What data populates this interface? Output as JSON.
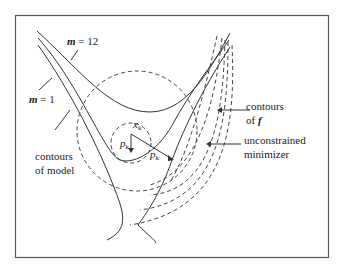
{
  "diagram": {
    "labels": {
      "m12_var": "m",
      "m12_eq": " = 12",
      "m1_var": "m",
      "m1_eq": " = 1",
      "model_line1": "contours",
      "model_line2": "of model",
      "f_line1": "contours",
      "f_line2_prefix": "of ",
      "f_line2_var": "f",
      "min_line1": "unconstrained",
      "min_line2": "minimizer",
      "xk_var": "x",
      "xk_sub": "k",
      "pk1_var": "p",
      "pk1_sub": "k",
      "pk2_var": "p",
      "pk2_sub": "k"
    },
    "colors": {
      "stroke": "#333333",
      "background": "#ffffff",
      "frame": "#555555"
    }
  }
}
